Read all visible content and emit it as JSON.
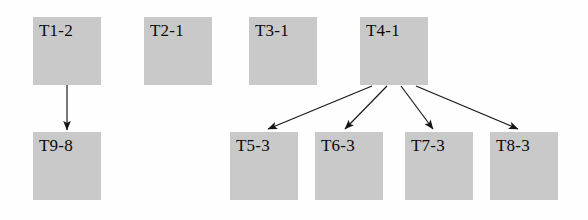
{
  "diagram": {
    "type": "task-dependency-graph",
    "title": "",
    "background_color": "#fefefe",
    "node_fill_color": "#c9c9c9",
    "node_text_color": "#0a0a0a",
    "edge_color": "#1a1a1a",
    "node_size": {
      "width": 68,
      "height": 68
    },
    "nodes": [
      {
        "id": "T1-2",
        "label": "T1-2",
        "x": 33,
        "y": 17,
        "row": "top"
      },
      {
        "id": "T2-1",
        "label": "T2-1",
        "x": 144,
        "y": 17,
        "row": "top"
      },
      {
        "id": "T3-1",
        "label": "T3-1",
        "x": 249,
        "y": 17,
        "row": "top"
      },
      {
        "id": "T4-1",
        "label": "T4-1",
        "x": 360,
        "y": 17,
        "row": "top"
      },
      {
        "id": "T9-8",
        "label": "T9-8",
        "x": 33,
        "y": 132,
        "row": "bottom"
      },
      {
        "id": "T5-3",
        "label": "T5-3",
        "x": 230,
        "y": 132,
        "row": "bottom"
      },
      {
        "id": "T6-3",
        "label": "T6-3",
        "x": 315,
        "y": 132,
        "row": "bottom"
      },
      {
        "id": "T7-3",
        "label": "T7-3",
        "x": 405,
        "y": 132,
        "row": "bottom"
      },
      {
        "id": "T8-3",
        "label": "T8-3",
        "x": 490,
        "y": 132,
        "row": "bottom"
      }
    ],
    "edges": [
      {
        "from": "T1-2",
        "to": "T9-8",
        "x1": 67,
        "y1": 85,
        "x2": 67,
        "y2": 130
      },
      {
        "from": "T4-1",
        "to": "T5-3",
        "x1": 372,
        "y1": 86,
        "x2": 268,
        "y2": 129
      },
      {
        "from": "T4-1",
        "to": "T6-3",
        "x1": 387,
        "y1": 86,
        "x2": 345,
        "y2": 129
      },
      {
        "from": "T4-1",
        "to": "T7-3",
        "x1": 401,
        "y1": 86,
        "x2": 433,
        "y2": 129
      },
      {
        "from": "T4-1",
        "to": "T8-3",
        "x1": 416,
        "y1": 86,
        "x2": 518,
        "y2": 129
      }
    ],
    "isolated_nodes": [
      "T2-1",
      "T3-1"
    ]
  }
}
